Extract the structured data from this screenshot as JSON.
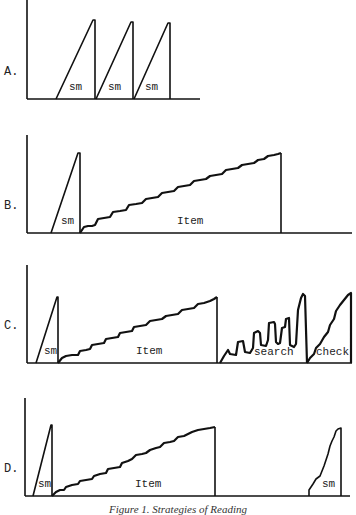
{
  "panels": [
    {
      "id": "A",
      "label": "A.",
      "segments": [
        {
          "label": "sm"
        },
        {
          "label": "sm"
        },
        {
          "label": "sm"
        }
      ]
    },
    {
      "id": "B",
      "label": "B.",
      "segments": [
        {
          "label": "sm"
        },
        {
          "label": "Item"
        }
      ]
    },
    {
      "id": "C",
      "label": "C.",
      "segments": [
        {
          "label": "sm"
        },
        {
          "label": "Item"
        },
        {
          "label": "search"
        },
        {
          "label": "check"
        }
      ]
    },
    {
      "id": "D",
      "label": "D.",
      "segments": [
        {
          "label": "sm"
        },
        {
          "label": "Item"
        },
        {
          "label": "sm"
        }
      ]
    }
  ],
  "caption": "Figure 1. Strategies of Reading",
  "colors": {
    "ink": "#111111",
    "background": "#ffffff"
  }
}
